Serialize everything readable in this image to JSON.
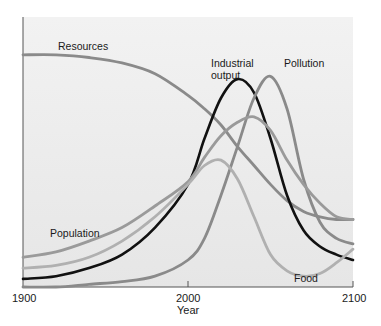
{
  "chart_data": {
    "type": "line",
    "title": "",
    "xlabel": "Year",
    "ylabel": "",
    "xlim": [
      1900,
      2100
    ],
    "ylim": [
      0,
      100
    ],
    "grid": false,
    "legend": "inline labels",
    "x_ticks": [
      "1900",
      "2000",
      "2100"
    ],
    "x": [
      1900,
      1920,
      1940,
      1960,
      1980,
      2000,
      2010,
      2020,
      2030,
      2040,
      2050,
      2060,
      2070,
      2080,
      2090,
      2100
    ],
    "series": [
      {
        "name": "Resources",
        "color": "#8a8a8a",
        "values": [
          86,
          86,
          85,
          83,
          79,
          71,
          66,
          60,
          52,
          45,
          38,
          32,
          28,
          26,
          25,
          25
        ]
      },
      {
        "name": "Industrial output",
        "color": "#111111",
        "values": [
          3,
          4,
          7,
          12,
          22,
          38,
          55,
          70,
          77,
          72,
          55,
          34,
          21,
          15,
          12,
          10
        ]
      },
      {
        "name": "Pollution",
        "color": "#8a8a8a",
        "values": [
          0,
          0,
          1,
          2,
          4,
          10,
          18,
          34,
          52,
          70,
          78,
          66,
          40,
          24,
          18,
          16
        ]
      },
      {
        "name": "Population",
        "color": "#9a9a9a",
        "values": [
          11,
          13,
          17,
          22,
          30,
          39,
          48,
          56,
          61,
          63,
          58,
          47,
          38,
          31,
          26,
          25
        ]
      },
      {
        "name": "Food",
        "color": "#b0b0b0",
        "values": [
          7,
          8,
          11,
          17,
          26,
          38,
          45,
          47,
          40,
          26,
          12,
          6,
          4,
          5,
          9,
          14
        ]
      }
    ],
    "labels": {
      "resources": "Resources",
      "industrial_line1": "Industrial",
      "industrial_line2": "output",
      "pollution": "Pollution",
      "population": "Population",
      "food": "Food"
    }
  }
}
